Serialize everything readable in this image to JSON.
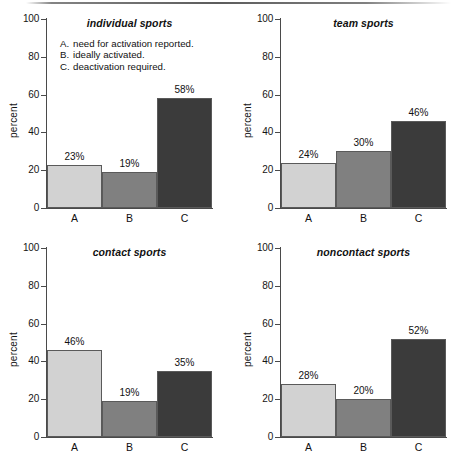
{
  "figure": {
    "ylabel": "percent",
    "y_ticks": [
      "0",
      "20",
      "40",
      "60",
      "80",
      "100"
    ],
    "x_categories": [
      "A",
      "B",
      "C"
    ],
    "legend": [
      {
        "key": "A.",
        "text": "need for activation reported."
      },
      {
        "key": "B.",
        "text": "ideally activated."
      },
      {
        "key": "C.",
        "text": "deactivation required."
      }
    ],
    "colors": {
      "bar_a": "#d2d2d2",
      "bar_b": "#808080",
      "bar_c": "#3b3b3b",
      "axis": "#4a4a4a",
      "text": "#111111",
      "background": "#ffffff"
    },
    "panels": [
      {
        "title": "individual sports",
        "values": [
          23,
          19,
          58
        ],
        "labels": [
          "23%",
          "19%",
          "58%"
        ]
      },
      {
        "title": "team sports",
        "values": [
          24,
          30,
          46
        ],
        "labels": [
          "24%",
          "30%",
          "46%"
        ]
      },
      {
        "title": "contact sports",
        "values": [
          46,
          19,
          35
        ],
        "labels": [
          "46%",
          "19%",
          "35%"
        ]
      },
      {
        "title": "noncontact sports",
        "values": [
          28,
          20,
          52
        ],
        "labels": [
          "28%",
          "20%",
          "52%"
        ]
      }
    ]
  },
  "chart_data": {
    "type": "bar",
    "title": "",
    "subtitle": "",
    "xlabel": "",
    "ylabel": "percent",
    "ylim": [
      0,
      100
    ],
    "yticks": [
      0,
      20,
      40,
      60,
      80,
      100
    ],
    "grid": false,
    "legend_position": "inside-top-left-panel",
    "categories": [
      "A",
      "B",
      "C"
    ],
    "category_descriptions": [
      "A. need for activation reported.",
      "B. ideally activated.",
      "C. deactivation required."
    ],
    "panels": [
      {
        "title": "individual sports",
        "categories": [
          "A",
          "B",
          "C"
        ],
        "values": [
          23,
          19,
          58
        ],
        "data_labels": [
          "23%",
          "19%",
          "58%"
        ]
      },
      {
        "title": "team sports",
        "categories": [
          "A",
          "B",
          "C"
        ],
        "values": [
          24,
          30,
          46
        ],
        "data_labels": [
          "24%",
          "30%",
          "46%"
        ]
      },
      {
        "title": "contact sports",
        "categories": [
          "A",
          "B",
          "C"
        ],
        "values": [
          46,
          19,
          35
        ],
        "data_labels": [
          "46%",
          "19%",
          "35%"
        ]
      },
      {
        "title": "noncontact sports",
        "categories": [
          "A",
          "B",
          "C"
        ],
        "values": [
          28,
          20,
          52
        ],
        "data_labels": [
          "28%",
          "20%",
          "52%"
        ]
      }
    ]
  }
}
